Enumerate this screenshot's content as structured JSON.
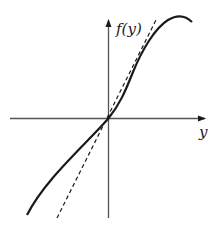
{
  "diagram": {
    "type": "function-plot",
    "y_axis_label": "f(y)",
    "x_axis_label": "y",
    "curves": [
      {
        "name": "f(y)",
        "style": "solid",
        "description": "S-shaped curve through origin, sub-linear for negative y, steep then saturating for positive y"
      },
      {
        "name": "tangent-at-origin",
        "style": "dashed",
        "description": "straight line through origin"
      }
    ],
    "colors": {
      "ink": "#1a1a1a",
      "axis": "#555555",
      "background": "#ffffff"
    }
  }
}
